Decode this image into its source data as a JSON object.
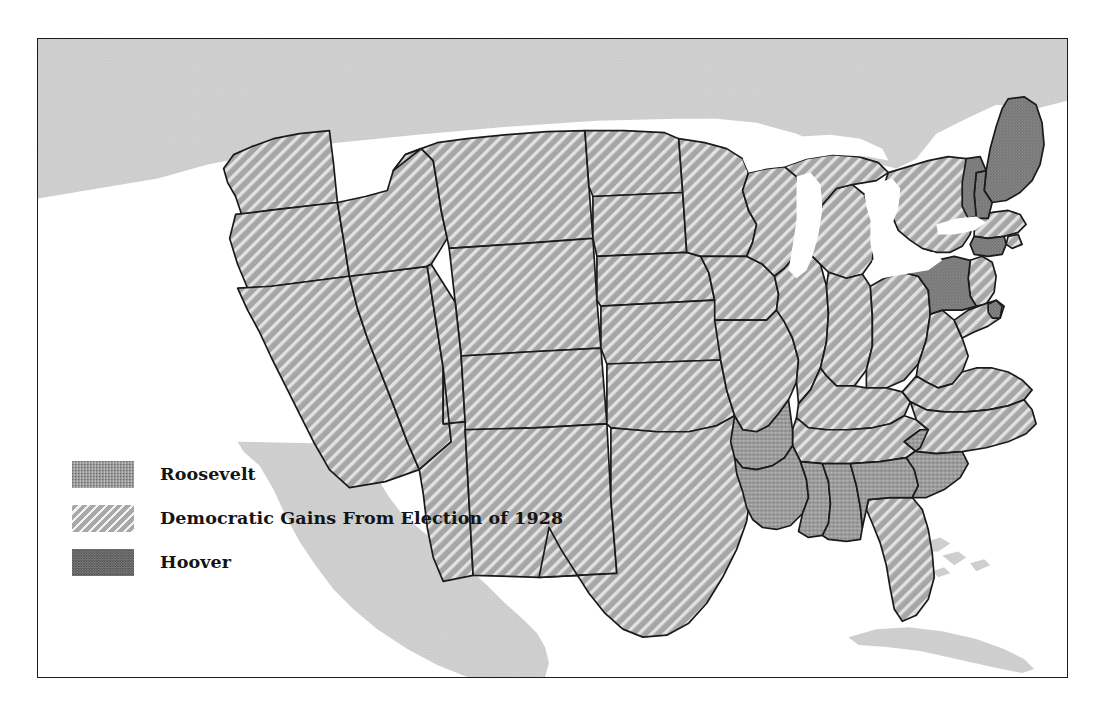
{
  "figure": {
    "kind": "choropleth-map",
    "frame_border_color": "#1c1c1c",
    "background_color": "#ffffff"
  },
  "legend": {
    "name": "map-legend",
    "items": [
      {
        "id": "roosevelt",
        "label": "Roosevelt",
        "pattern": "stipple",
        "color": "#9c9c9c"
      },
      {
        "id": "gains",
        "label": "Democratic Gains From Election of 1928",
        "pattern": "diagonal-hatch",
        "color": "#a8a8a8"
      },
      {
        "id": "hoover",
        "label": "Hoover",
        "pattern": "dense-stipple",
        "color": "#8a8a8a"
      }
    ]
  },
  "map_data": {
    "type": "choropleth",
    "categories": [
      "roosevelt",
      "gains",
      "hoover"
    ],
    "water_color": "#ffffff",
    "foreign_land_color": "#cfcfcf",
    "state_border_color": "#1a1a1a",
    "regions": {
      "hoover": [
        "Maine",
        "New Hampshire",
        "Vermont",
        "Connecticut",
        "Pennsylvania",
        "Delaware"
      ],
      "roosevelt": [
        "Arkansas",
        "Louisiana",
        "Mississippi",
        "Alabama",
        "Georgia",
        "South Carolina"
      ],
      "gains": [
        "Washington",
        "Oregon",
        "California",
        "Nevada",
        "Idaho",
        "Montana",
        "Wyoming",
        "Utah",
        "Arizona",
        "New Mexico",
        "Colorado",
        "North Dakota",
        "South Dakota",
        "Nebraska",
        "Kansas",
        "Oklahoma",
        "Texas",
        "Minnesota",
        "Iowa",
        "Missouri",
        "Wisconsin",
        "Illinois",
        "Michigan",
        "Indiana",
        "Ohio",
        "Kentucky",
        "Tennessee",
        "West Virginia",
        "Virginia",
        "North Carolina",
        "Florida",
        "New York",
        "Massachusetts",
        "Rhode Island",
        "New Jersey",
        "Maryland"
      ]
    },
    "neighbors": [
      "Canada",
      "Mexico",
      "Cuba",
      "Bahamas"
    ]
  }
}
